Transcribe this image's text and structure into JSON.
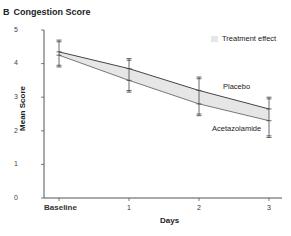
{
  "chart_data": {
    "type": "line",
    "panel_label": "B",
    "title": "Congestion Score",
    "xlabel": "Days",
    "ylabel": "Mean Score",
    "categories": [
      "Baseline",
      "1",
      "2",
      "3"
    ],
    "ylim": [
      0,
      5
    ],
    "yticks": [
      "0",
      "1",
      "2",
      "3",
      "4",
      "5"
    ],
    "grid": false,
    "legend": {
      "position": "top-right",
      "entries": [
        "Treatment effect"
      ]
    },
    "series": [
      {
        "name": "Placebo",
        "values": [
          4.35,
          3.85,
          3.2,
          2.65
        ],
        "ci_low": [
          3.95,
          3.35,
          2.7,
          2.1
        ],
        "ci_high": [
          4.7,
          4.15,
          3.6,
          3.0
        ]
      },
      {
        "name": "Acetazolamide",
        "values": [
          4.25,
          3.5,
          2.8,
          2.3
        ],
        "ci_low": [
          3.9,
          3.15,
          2.45,
          1.8
        ],
        "ci_high": [
          4.6,
          3.85,
          3.2,
          2.7
        ]
      }
    ],
    "annotations": [
      "Placebo",
      "Acetazolamide"
    ],
    "shaded_region": "Treatment effect (area between Placebo and Acetazolamide lines)"
  },
  "labels": {
    "panel": "B",
    "title": "Congestion Score",
    "ylabel": "Mean Score",
    "xlabel": "Days",
    "legend": "Treatment effect",
    "placebo": "Placebo",
    "acetazolamide": "Acetazolamide",
    "yticks": [
      "0",
      "1",
      "2",
      "3",
      "4",
      "5"
    ],
    "xticks": [
      "Baseline",
      "1",
      "2",
      "3"
    ]
  },
  "colors": {
    "fill": "#e6e6e6",
    "line": "#444444"
  }
}
